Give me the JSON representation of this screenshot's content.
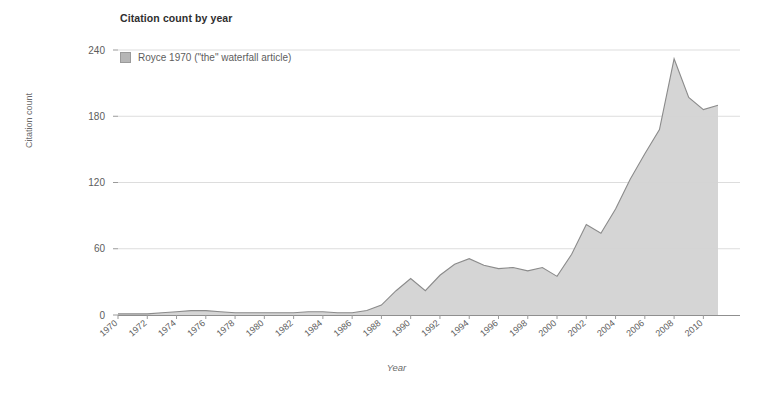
{
  "chart_data": {
    "type": "area",
    "title": "Citation count by year",
    "xlabel": "Year",
    "ylabel": "Citation count",
    "grid": true,
    "legend_position": "top-left",
    "xlim": [
      1970,
      2011
    ],
    "ylim": [
      0,
      240
    ],
    "ytick_labels": [
      "0",
      "60",
      "120",
      "180",
      "240"
    ],
    "ytick_values": [
      0,
      60,
      120,
      180,
      240
    ],
    "xtick_labels": [
      "1970",
      "1972",
      "1974",
      "1976",
      "1978",
      "1980",
      "1982",
      "1984",
      "1986",
      "1988",
      "1990",
      "1992",
      "1994",
      "1996",
      "1998",
      "2000",
      "2002",
      "2004",
      "2006",
      "2008",
      "2010"
    ],
    "xtick_values": [
      1970,
      1972,
      1974,
      1976,
      1978,
      1980,
      1982,
      1984,
      1986,
      1988,
      1990,
      1992,
      1994,
      1996,
      1998,
      2000,
      2002,
      2004,
      2006,
      2008,
      2010
    ],
    "series": [
      {
        "name": "Royce 1970 (\"the\" waterfall article)",
        "color": "#d3d3d3",
        "x": [
          1970,
          1971,
          1972,
          1973,
          1974,
          1975,
          1976,
          1977,
          1978,
          1979,
          1980,
          1981,
          1982,
          1983,
          1984,
          1985,
          1986,
          1987,
          1988,
          1989,
          1990,
          1991,
          1992,
          1993,
          1994,
          1995,
          1996,
          1997,
          1998,
          1999,
          2000,
          2001,
          2002,
          2003,
          2004,
          2005,
          2006,
          2007,
          2008,
          2009,
          2010,
          2011
        ],
        "values": [
          1,
          1,
          1,
          2,
          3,
          4,
          4,
          3,
          2,
          2,
          2,
          2,
          2,
          3,
          3,
          2,
          2,
          4,
          9,
          22,
          33,
          22,
          36,
          46,
          51,
          45,
          42,
          43,
          40,
          43,
          35,
          55,
          82,
          74,
          96,
          123,
          146,
          168,
          232,
          197,
          186,
          190
        ]
      }
    ]
  },
  "axis": {
    "y_title": "Citation count",
    "x_title": "Year"
  },
  "legend": {
    "entries": [
      {
        "label": "Royce 1970 (\"the\" waterfall article)",
        "swatch_color": "#b6b6b6"
      }
    ]
  }
}
